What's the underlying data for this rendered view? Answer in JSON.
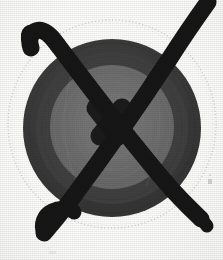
{
  "image": {
    "kind": "scanned-photograph",
    "subject": "circular-disc-target",
    "annotation": "hand-drawn-x-crossout",
    "width": 223,
    "height": 260,
    "alt_text": "Dark circular disc with concentric rings, crossed out with a heavy hand-drawn black X"
  },
  "colors": {
    "background": "#fdfdfc",
    "outer_dotted_ring": "#c9c7c2",
    "disc_outer_ring": "#3c3c3c",
    "disc_mid_ring": "#4a4a4a",
    "disc_inner_disc": "#6e6e6e",
    "disc_core": "#757575",
    "ink_black": "#141414",
    "speck": "#b9b7b2"
  },
  "geometry": {
    "dotted_circle": {
      "cx": 112,
      "cy": 124,
      "r": 104
    },
    "disc": {
      "cx": 112,
      "cy": 128,
      "r_outer": 89,
      "r_mid": 76,
      "r_inner": 62,
      "r_core": 34
    }
  },
  "marks": {
    "stroke_a_label": "x-stroke-top-left-to-bottom-right",
    "stroke_b_label": "x-stroke-bottom-left-to-top-right",
    "hook_top_left_label": "pen-hook-start",
    "hook_bottom_left_label": "pen-hook-turn",
    "speck_label": "stray-ink-speck"
  }
}
